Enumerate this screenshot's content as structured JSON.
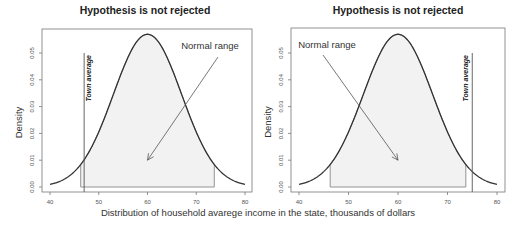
{
  "chart_data": [
    {
      "type": "line",
      "title": "Hypothesis is not rejected",
      "xlabel": "Distribution of household avarege income in the state, thousands of dollars",
      "ylabel": "Density",
      "xlim": [
        40,
        80
      ],
      "ylim": [
        0,
        0.057
      ],
      "x_ticks": [
        40,
        50,
        60,
        70,
        80
      ],
      "y_ticks": [
        0.0,
        0.01,
        0.02,
        0.03,
        0.04,
        0.05
      ],
      "y_tick_labels": [
        "0.00",
        "0.01",
        "0.02",
        "0.03",
        "0.04",
        "0.05"
      ],
      "x_tick_labels": [
        "40",
        "50",
        "60",
        "70",
        "80"
      ],
      "distribution": {
        "kind": "normal",
        "mean": 60,
        "sd": 7
      },
      "normal_range": [
        46.3,
        73.7
      ],
      "town_average": {
        "x": 47,
        "label": "Town average",
        "top_y": 0.05
      },
      "annotation": {
        "text": "Normal range",
        "arrow_to": [
          60,
          0.01
        ]
      },
      "grid": false
    },
    {
      "type": "line",
      "title": "Hypothesis is not rejected",
      "xlabel": "Distribution of household avarege income in the state, thousands of dollars",
      "ylabel": "Density",
      "xlim": [
        40,
        80
      ],
      "ylim": [
        0,
        0.057
      ],
      "x_ticks": [
        40,
        50,
        60,
        70,
        80
      ],
      "y_ticks": [
        0.0,
        0.01,
        0.02,
        0.03,
        0.04,
        0.05
      ],
      "y_tick_labels": [
        "0.00",
        "0.01",
        "0.02",
        "0.03",
        "0.04",
        "0.05"
      ],
      "x_tick_labels": [
        "40",
        "50",
        "60",
        "70",
        "80"
      ],
      "distribution": {
        "kind": "normal",
        "mean": 60,
        "sd": 7
      },
      "normal_range": [
        46.3,
        73.7
      ],
      "town_average": {
        "x": 75,
        "label": "Town average",
        "top_y": 0.05
      },
      "annotation": {
        "text": "Normal range",
        "arrow_to": [
          60,
          0.01
        ]
      },
      "grid": false
    }
  ],
  "shared_xlabel": "Distribution of household avarege income in the state, thousands of dollars"
}
